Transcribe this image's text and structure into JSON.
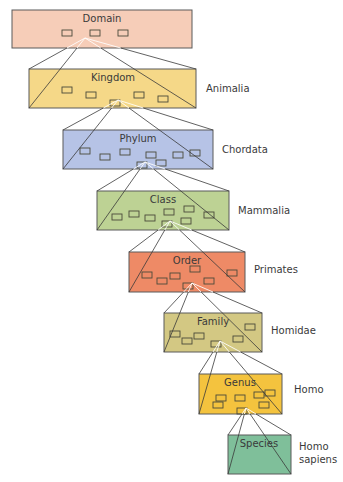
{
  "diagram": {
    "levels": [
      {
        "rank": "Domain",
        "name": "",
        "color": "#f6cdb8",
        "x": 12,
        "y": 10,
        "w": 180,
        "h": 38,
        "boxes": [
          [
            62,
            30
          ],
          [
            90,
            30
          ],
          [
            118,
            30
          ]
        ],
        "pivot": [
          80,
          38
        ]
      },
      {
        "rank": "Kingdom",
        "name": "Animalia",
        "color": "#f5d888",
        "x": 29,
        "y": 69,
        "w": 167,
        "h": 39,
        "boxes": [
          [
            62,
            87
          ],
          [
            86,
            92
          ],
          [
            134,
            92
          ],
          [
            158,
            96
          ],
          [
            110,
            100
          ]
        ],
        "pivot": [
          113,
          100
        ]
      },
      {
        "rank": "Phylum",
        "name": "Chordata",
        "color": "#b6c3e6",
        "x": 63,
        "y": 130,
        "w": 150,
        "h": 39,
        "boxes": [
          [
            80,
            148
          ],
          [
            100,
            154
          ],
          [
            120,
            149
          ],
          [
            146,
            152
          ],
          [
            173,
            152
          ],
          [
            190,
            150
          ],
          [
            156,
            160
          ],
          [
            137,
            162
          ]
        ],
        "pivot": [
          140,
          162
        ]
      },
      {
        "rank": "Class",
        "name": "Mammalia",
        "color": "#bdd294",
        "x": 97,
        "y": 191,
        "w": 132,
        "h": 39,
        "boxes": [
          [
            112,
            214
          ],
          [
            129,
            211
          ],
          [
            145,
            215
          ],
          [
            164,
            209
          ],
          [
            184,
            206
          ],
          [
            204,
            212
          ],
          [
            181,
            218
          ],
          [
            162,
            221
          ]
        ],
        "pivot": [
          165,
          221
        ]
      },
      {
        "rank": "Order",
        "name": "Primates",
        "color": "#ee8a66",
        "x": 129,
        "y": 252,
        "w": 116,
        "h": 40,
        "boxes": [
          [
            142,
            272
          ],
          [
            157,
            278
          ],
          [
            170,
            273
          ],
          [
            190,
            266
          ],
          [
            204,
            278
          ],
          [
            227,
            270
          ],
          [
            183,
            283
          ]
        ],
        "pivot": [
          187,
          283
        ]
      },
      {
        "rank": "Family",
        "name": "Homidae",
        "color": "#d3c883",
        "x": 164,
        "y": 313,
        "w": 98,
        "h": 39,
        "boxes": [
          [
            170,
            331
          ],
          [
            182,
            338
          ],
          [
            194,
            333
          ],
          [
            211,
            341
          ],
          [
            233,
            336
          ],
          [
            245,
            324
          ]
        ],
        "pivot": [
          215,
          341
        ]
      },
      {
        "rank": "Genus",
        "name": "Homo",
        "color": "#f4c33e",
        "x": 199,
        "y": 374,
        "w": 83,
        "h": 40,
        "boxes": [
          [
            216,
            395
          ],
          [
            235,
            395
          ],
          [
            254,
            392
          ],
          [
            265,
            390
          ],
          [
            213,
            402
          ],
          [
            259,
            402
          ],
          [
            237,
            408
          ]
        ],
        "pivot": [
          241,
          408
        ]
      },
      {
        "rank": "Species",
        "name": "Homo sapiens",
        "name_lines": [
          "Homo",
          "sapiens"
        ],
        "color": "#7fbf9a",
        "x": 228,
        "y": 435,
        "w": 63,
        "h": 39,
        "boxes": [],
        "pivot": null
      }
    ]
  },
  "labels": {
    "domain": "Domain",
    "kingdom": "Kingdom",
    "kingdom_name": "Animalia",
    "phylum": "Phylum",
    "phylum_name": "Chordata",
    "class": "Class",
    "class_name": "Mammalia",
    "order": "Order",
    "order_name": "Primates",
    "family": "Family",
    "family_name": "Homidae",
    "genus": "Genus",
    "genus_name": "Homo",
    "species": "Species",
    "species_name_1": "Homo",
    "species_name_2": "sapiens"
  }
}
